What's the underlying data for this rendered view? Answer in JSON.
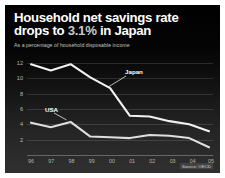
{
  "chart_data": {
    "type": "line",
    "title": "Household net savings rate drops to 3.1% in Japan",
    "title_part1": "Household net savings rate drops to ",
    "title_highlight": "3.1%",
    "title_part2": " in Japan",
    "subtitle": "As a percentage of household disposable income",
    "xlabel": "",
    "ylabel": "",
    "categories": [
      "96",
      "97",
      "98",
      "99",
      "00",
      "01",
      "02",
      "03",
      "04",
      "05"
    ],
    "x_tick_labels": [
      "96",
      "97",
      "98",
      "99",
      "00",
      "01",
      "02",
      "03",
      "04",
      "05"
    ],
    "y_tick_labels": [
      "12",
      "10",
      "8",
      "6",
      "4",
      "2"
    ],
    "y_ticks": [
      12,
      10,
      8,
      6,
      4,
      2
    ],
    "ylim": [
      0,
      13
    ],
    "grid": true,
    "legend_position": "inline-annotation",
    "series": [
      {
        "name": "Japan",
        "color": "#f2f2f2",
        "values": [
          11.8,
          11.0,
          11.8,
          10.1,
          8.7,
          5.1,
          5.0,
          4.4,
          4.0,
          3.1
        ],
        "label_text": "Japan"
      },
      {
        "name": "USA",
        "color": "#dedede",
        "values": [
          4.2,
          3.6,
          4.3,
          2.4,
          2.3,
          2.2,
          2.6,
          2.5,
          2.2,
          1.0
        ],
        "label_text": "USA"
      }
    ],
    "annotations": [
      {
        "text": "Japan",
        "series": "Japan"
      },
      {
        "text": "USA",
        "series": "USA"
      }
    ],
    "source": "Source: OECD"
  },
  "colors": {
    "background": "#000000",
    "frame_border": "#ffffff",
    "text": "#ffffff",
    "highlight": "#c9c9c9",
    "grid": "rgba(255,255,255,0.13)"
  }
}
